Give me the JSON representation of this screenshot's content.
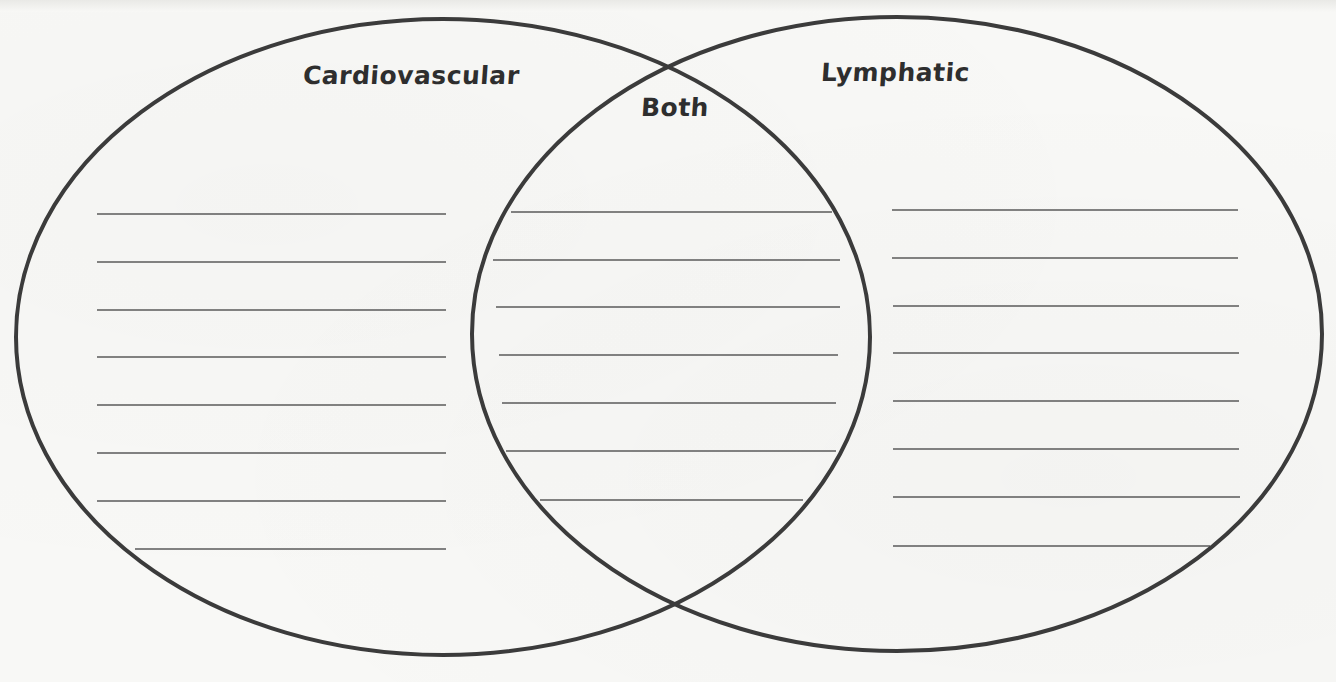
{
  "worksheet": {
    "type": "venn-diagram",
    "background_color": "#f8f8f6",
    "outline_color": "#3b3b3b",
    "line_color": "#5a5a5a"
  },
  "labels": {
    "left": "Cardiovascular",
    "right": "Lymphatic",
    "overlap": "Both"
  },
  "circles": {
    "left": {
      "cx": 443,
      "cy": 337,
      "rx": 427,
      "ry": 318
    },
    "right": {
      "cx": 897,
      "cy": 334,
      "rx": 425,
      "ry": 317
    }
  },
  "writing_lines": {
    "left": [
      {
        "y": 214,
        "x1": 97,
        "x2": 446
      },
      {
        "y": 262,
        "x1": 97,
        "x2": 446
      },
      {
        "y": 310,
        "x1": 97,
        "x2": 446
      },
      {
        "y": 357,
        "x1": 97,
        "x2": 446
      },
      {
        "y": 405,
        "x1": 97,
        "x2": 446
      },
      {
        "y": 453,
        "x1": 97,
        "x2": 446
      },
      {
        "y": 501,
        "x1": 97,
        "x2": 446
      },
      {
        "y": 549,
        "x1": 135,
        "x2": 446
      }
    ],
    "overlap": [
      {
        "y": 212,
        "x1": 511,
        "x2": 832
      },
      {
        "y": 260,
        "x1": 493,
        "x2": 840
      },
      {
        "y": 307,
        "x1": 496,
        "x2": 840
      },
      {
        "y": 355,
        "x1": 499,
        "x2": 838
      },
      {
        "y": 403,
        "x1": 502,
        "x2": 836
      },
      {
        "y": 451,
        "x1": 506,
        "x2": 836
      },
      {
        "y": 500,
        "x1": 540,
        "x2": 803
      }
    ],
    "right": [
      {
        "y": 210,
        "x1": 892,
        "x2": 1238
      },
      {
        "y": 258,
        "x1": 892,
        "x2": 1238
      },
      {
        "y": 306,
        "x1": 893,
        "x2": 1239
      },
      {
        "y": 353,
        "x1": 893,
        "x2": 1239
      },
      {
        "y": 401,
        "x1": 893,
        "x2": 1239
      },
      {
        "y": 449,
        "x1": 893,
        "x2": 1239
      },
      {
        "y": 497,
        "x1": 893,
        "x2": 1240
      },
      {
        "y": 546,
        "x1": 893,
        "x2": 1210
      }
    ]
  }
}
